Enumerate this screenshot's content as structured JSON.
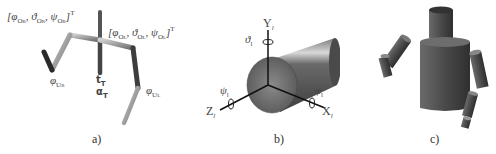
{
  "figure": {
    "panels": [
      {
        "caption": "a)",
        "title": "stick-figure kinematic model",
        "labels": {
          "shoulder_right": "[φO_R, ϑO_R, ψO_R]^T",
          "shoulder_left": "[φO_L, ϑO_L, ψO_L]^T",
          "elbow_right": "φU_R",
          "elbow_left": "φU_L",
          "torso_t": "t_T",
          "torso_alpha": "α_T"
        }
      },
      {
        "caption": "b)",
        "title": "cylinder with local coordinate frame",
        "labels": {
          "y_axis": "Y_l",
          "x_axis": "X_l",
          "z_axis": "Z_l",
          "theta": "ϑ_l",
          "phi": "φ_l",
          "psi": "ψ_l"
        }
      },
      {
        "caption": "c)",
        "title": "cylinder-based body model"
      }
    ]
  },
  "text": {
    "a_sr_phi": "φ",
    "a_sr_phi_sub": "O",
    "a_sr_phi_subsub": "R",
    "a_sr_theta": "ϑ",
    "a_sr_psi": "ψ",
    "a_sl_phi": "φ",
    "a_sl_theta": "ϑ",
    "a_sl_psi": "ψ",
    "a_sub_OR": "O",
    "a_sub_R": "R",
    "a_sub_OL": "O",
    "a_sub_L": "L",
    "a_sup_T": "T",
    "a_elbow_r": "φ",
    "a_elbow_r_sub": "U",
    "a_elbow_r_subsub": "R",
    "a_elbow_l": "φ",
    "a_elbow_l_sub": "U",
    "a_elbow_l_subsub": "L",
    "a_t": "t",
    "a_t_sub": "T",
    "a_alpha": "α",
    "a_alpha_sub": "T",
    "b_Y": "Y",
    "b_X": "X",
    "b_Z": "Z",
    "b_sub_l": "l",
    "b_theta": "ϑ",
    "b_phi": "φ",
    "b_psi": "ψ",
    "cap_a": "a)",
    "cap_b": "b)",
    "cap_c": "c)"
  },
  "colors": {
    "stick_light": "#b8b8b8",
    "stick_dark": "#3a3a3a",
    "cylinder": "#5a5a5a",
    "cylinder_face": "#6e6e6e",
    "axes": "#111111"
  }
}
